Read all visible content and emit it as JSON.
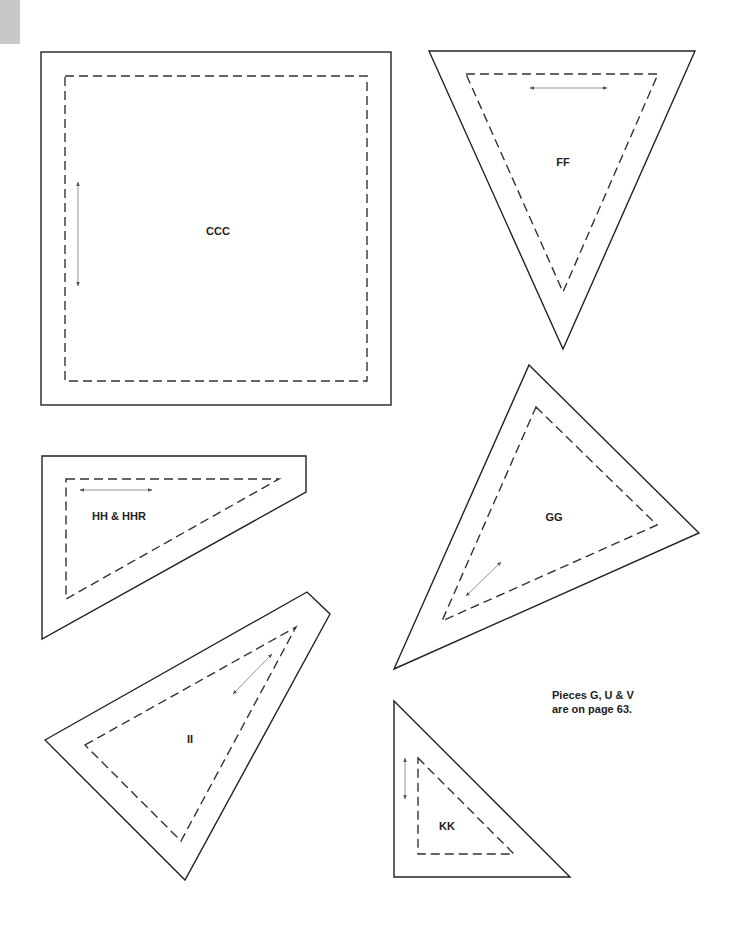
{
  "page": {
    "corner_tab_color": "#c8c8c8"
  },
  "pieces": {
    "ccc": {
      "label": "CCC",
      "shape": "square",
      "grainline": "vertical"
    },
    "ff": {
      "label": "FF",
      "shape": "inverted-triangle",
      "grainline": "horizontal"
    },
    "hh": {
      "label": "HH & HHR",
      "shape": "right-trapezoid",
      "grainline": "horizontal"
    },
    "gg": {
      "label": "GG",
      "shape": "triangle",
      "grainline": "diagonal"
    },
    "ii": {
      "label": "II",
      "shape": "triangle",
      "grainline": "diagonal"
    },
    "kk": {
      "label": "KK",
      "shape": "right-triangle",
      "grainline": "vertical"
    }
  },
  "note": {
    "line1": "Pieces G, U & V",
    "line2": "are on page 63."
  }
}
